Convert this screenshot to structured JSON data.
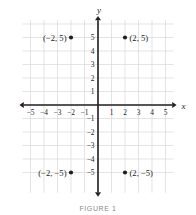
{
  "figure": {
    "caption": "FIGURE 1",
    "axis_x_label": "x",
    "axis_y_label": "y"
  },
  "colors": {
    "grid": "#d9d9d9",
    "axis": "#231f20",
    "text": "#231f20",
    "caption": "#8a8a8a",
    "point": "#231f20",
    "background": "#ffffff"
  },
  "chart_data": {
    "type": "scatter",
    "title": "",
    "xlabel": "x",
    "ylabel": "y",
    "xlim": [
      -5.6,
      5.6
    ],
    "ylim": [
      -6.5,
      6.3
    ],
    "grid": true,
    "legend": false,
    "x_ticks": [
      -5,
      -4,
      -3,
      -2,
      -1,
      1,
      2,
      3,
      4,
      5
    ],
    "x_tick_labels": [
      "−5",
      "−4",
      "−3",
      "−2",
      "−1",
      "1",
      "2",
      "3",
      "4",
      "5"
    ],
    "y_ticks": [
      5,
      4,
      3,
      2,
      1,
      -1,
      -2,
      -3,
      -4,
      -5
    ],
    "y_tick_labels": [
      "5",
      "4",
      "3",
      "2",
      "1",
      "−1",
      "−2",
      "−3",
      "−4",
      "−5"
    ],
    "points": [
      {
        "x": -2,
        "y": 5,
        "label": "(−2, 5)",
        "label_side": "left"
      },
      {
        "x": 2,
        "y": 5,
        "label": "(2, 5)",
        "label_side": "right"
      },
      {
        "x": -2,
        "y": -5,
        "label": "(−2, −5)",
        "label_side": "left"
      },
      {
        "x": 2,
        "y": -5,
        "label": "(2, −5)",
        "label_side": "right"
      }
    ]
  }
}
